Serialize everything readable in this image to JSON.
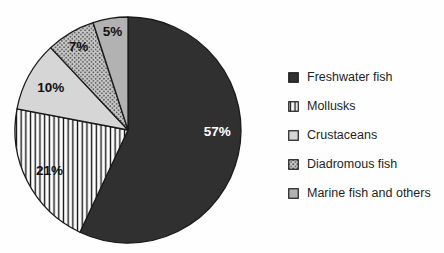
{
  "chart_data": {
    "type": "pie",
    "title": "",
    "start_angle_deg": 0,
    "direction": "clockwise",
    "legend_position": "right",
    "categories": [
      "Freshwater fish",
      "Mollusks",
      "Crustaceans",
      "Diadromous fish",
      "Marine fish and others"
    ],
    "values": [
      57,
      21,
      10,
      7,
      5
    ],
    "slices": [
      {
        "label": "Freshwater fish",
        "value": 57,
        "display": "57%",
        "pattern": "solid",
        "fill": "#303030",
        "text_color": "#ffffff"
      },
      {
        "label": "Mollusks",
        "value": 21,
        "display": "21%",
        "pattern": "vertical-stripes",
        "fill": "#ffffff",
        "text_color": "#111111"
      },
      {
        "label": "Crustaceans",
        "value": 10,
        "display": "10%",
        "pattern": "solid",
        "fill": "#d6d6d6",
        "text_color": "#111111"
      },
      {
        "label": "Diadromous fish",
        "value": 7,
        "display": "7%",
        "pattern": "diamond-dots",
        "fill": "#c9c9c9",
        "text_color": "#111111"
      },
      {
        "label": "Marine fish and others",
        "value": 5,
        "display": "5%",
        "pattern": "solid",
        "fill": "#b2b2b2",
        "text_color": "#111111"
      }
    ]
  },
  "style": {
    "slice_border_color": "#1a1a1a",
    "stripe_line_color": "#141414",
    "dot_color": "#474747",
    "dot_background": "#c9c9c9",
    "legend_text_color": "#1f1f1f",
    "background": "#fefefe"
  }
}
